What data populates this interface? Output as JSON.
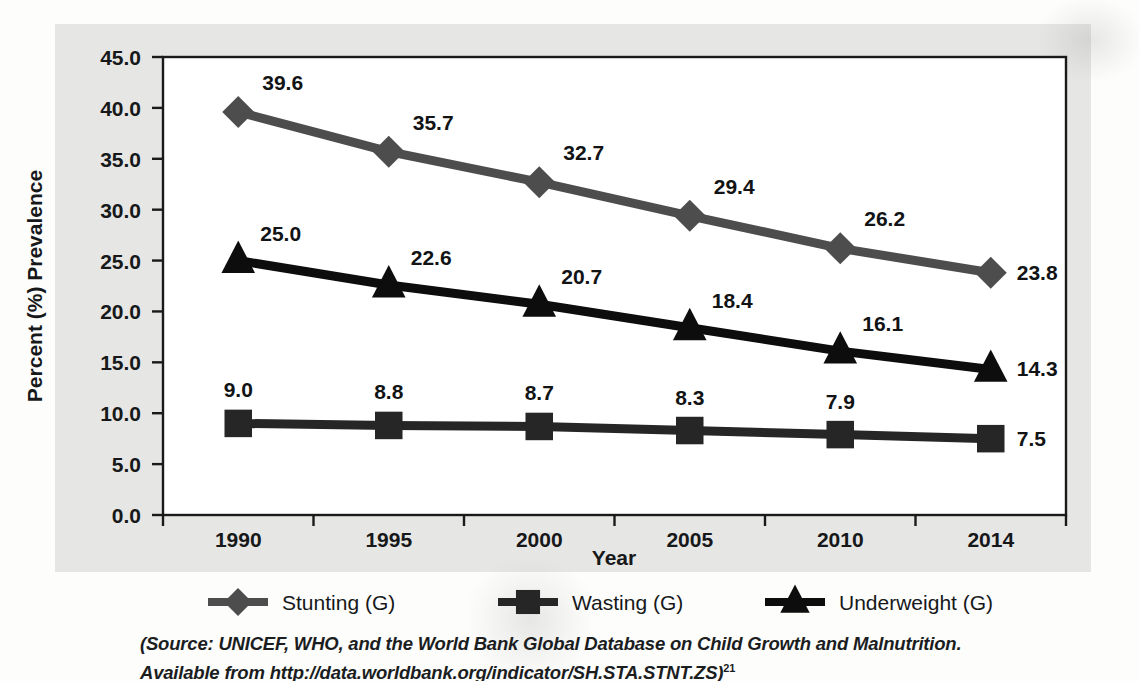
{
  "chart_data": {
    "type": "line",
    "title": "",
    "subtitle": "",
    "xlabel": "Year",
    "ylabel": "Percent (%) Prevalence",
    "categories": [
      "1990",
      "1995",
      "2000",
      "2005",
      "2010",
      "2014"
    ],
    "x": [
      1990,
      1995,
      2000,
      2005,
      2010,
      2014
    ],
    "ylim": [
      0.0,
      45.0
    ],
    "ytick_step": 5.0,
    "yticks": [
      "0.0",
      "5.0",
      "10.0",
      "15.0",
      "20.0",
      "25.0",
      "30.0",
      "35.0",
      "40.0",
      "45.0"
    ],
    "grid": false,
    "legend_position": "bottom",
    "data_labels": true,
    "series": [
      {
        "name": "Stunting (G)",
        "marker": "diamond",
        "color": "#4d4d4d",
        "values": [
          39.6,
          35.7,
          32.7,
          29.4,
          26.2,
          23.8
        ],
        "labels": [
          "39.6",
          "35.7",
          "32.7",
          "29.4",
          "26.2",
          "23.8"
        ]
      },
      {
        "name": "Wasting (G)",
        "marker": "square",
        "color": "#262626",
        "values": [
          9.0,
          8.8,
          8.7,
          8.3,
          7.9,
          7.5
        ],
        "labels": [
          "9.0",
          "8.8",
          "8.7",
          "8.3",
          "7.9",
          "7.5"
        ]
      },
      {
        "name": "Underweight (G)",
        "marker": "triangle",
        "color": "#0d0d0d",
        "values": [
          25.0,
          22.6,
          20.7,
          18.4,
          16.1,
          14.3
        ],
        "labels": [
          "25.0",
          "22.6",
          "20.7",
          "18.4",
          "16.1",
          "14.3"
        ]
      }
    ]
  },
  "legend": {
    "items": [
      {
        "label": "Stunting (G)",
        "marker": "diamond",
        "color": "#4d4d4d"
      },
      {
        "label": "Wasting (G)",
        "marker": "square",
        "color": "#262626"
      },
      {
        "label": "Underweight (G)",
        "marker": "triangle",
        "color": "#0d0d0d"
      }
    ]
  },
  "source": {
    "line1": "(Source: UNICEF, WHO, and the World Bank Global Database on Child Growth and Malnutrition.",
    "line2": "Available from http://data.worldbank.org/indicator/SH.STA.STNT.ZS)",
    "superscript": "21"
  },
  "colors": {
    "plate_background": "#e6e6e4",
    "plot_background": "#ffffff",
    "axis": "#1a1a1a",
    "text": "#16181a"
  }
}
